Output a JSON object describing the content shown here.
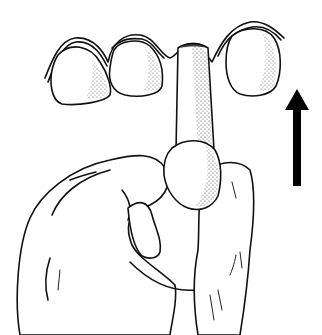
{
  "figure": {
    "colors": {
      "ink": "#111111",
      "background": "#ffffff",
      "stipple": "#333333"
    },
    "elements": [
      "teeth-row",
      "gum-line",
      "dental-stick",
      "hand",
      "thumb",
      "up-arrow"
    ]
  }
}
